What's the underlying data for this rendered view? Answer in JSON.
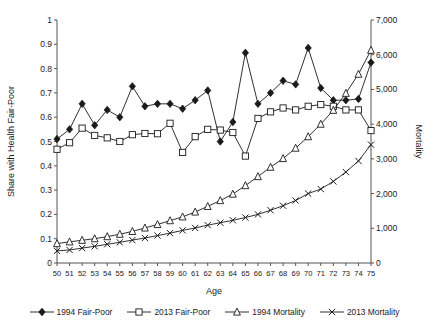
{
  "chart_data": {
    "type": "line",
    "title": "",
    "xlabel": "Age",
    "ylabel": "Share with Health Fair-Poor",
    "y2label": "Mortality",
    "xlim": [
      50,
      75
    ],
    "ylim": [
      0,
      1
    ],
    "y2lim": [
      0,
      7000
    ],
    "grid": false,
    "legend_position": "bottom",
    "x": [
      50,
      51,
      52,
      53,
      54,
      55,
      56,
      57,
      58,
      59,
      60,
      61,
      62,
      63,
      64,
      65,
      66,
      67,
      68,
      69,
      70,
      71,
      72,
      73,
      74,
      75
    ],
    "xtick_labels": [
      "50",
      "51",
      "52",
      "53",
      "54",
      "55",
      "56",
      "57",
      "58",
      "59",
      "60",
      "61",
      "62",
      "63",
      "64",
      "65",
      "66",
      "67",
      "68",
      "69",
      "70",
      "71",
      "72",
      "73",
      "74",
      "75"
    ],
    "ytick_labels": [
      "0",
      "0.1",
      "0.2",
      "0.3",
      "0.4",
      "0.5",
      "0.6",
      "0.7",
      "0.8",
      "0.9",
      "1"
    ],
    "ytick_values": [
      0,
      0.1,
      0.2,
      0.3,
      0.4,
      0.5,
      0.6,
      0.7,
      0.8,
      0.9,
      1
    ],
    "y2tick_labels": [
      "0",
      "1,000",
      "2,000",
      "3,000",
      "4,000",
      "5,000",
      "6,000",
      "7,000"
    ],
    "y2tick_values": [
      0,
      1000,
      2000,
      3000,
      4000,
      5000,
      6000,
      7000
    ],
    "series": [
      {
        "name": "1994 Fair-Poor",
        "axis": "left",
        "marker": "filled-diamond",
        "values": [
          0.51,
          0.55,
          0.655,
          0.567,
          0.63,
          0.6,
          0.727,
          0.645,
          0.655,
          0.655,
          0.635,
          0.67,
          0.71,
          0.5,
          0.58,
          0.865,
          0.655,
          0.7,
          0.75,
          0.735,
          0.885,
          0.72,
          0.67,
          0.67,
          0.675,
          0.825
        ]
      },
      {
        "name": "2013 Fair-Poor",
        "axis": "left",
        "marker": "open-square",
        "values": [
          0.468,
          0.495,
          0.555,
          0.525,
          0.515,
          0.5,
          0.528,
          0.533,
          0.532,
          0.575,
          0.455,
          0.52,
          0.55,
          0.547,
          0.537,
          0.44,
          0.595,
          0.622,
          0.638,
          0.63,
          0.645,
          0.652,
          0.645,
          0.63,
          0.63,
          0.545
        ]
      },
      {
        "name": "1994 Mortality",
        "axis": "right",
        "marker": "open-triangle",
        "values": [
          560,
          610,
          655,
          700,
          760,
          830,
          910,
          1010,
          1110,
          1220,
          1330,
          1470,
          1630,
          1800,
          1985,
          2230,
          2490,
          2760,
          3010,
          3310,
          3640,
          4000,
          4400,
          4890,
          5440,
          6130
        ]
      },
      {
        "name": "2013 Mortality",
        "axis": "right",
        "marker": "x-cross",
        "values": [
          350,
          375,
          430,
          480,
          540,
          595,
          660,
          720,
          790,
          860,
          940,
          1010,
          1090,
          1160,
          1230,
          1310,
          1400,
          1520,
          1650,
          1800,
          2000,
          2130,
          2350,
          2620,
          2940,
          3410
        ]
      }
    ]
  },
  "legend": {
    "items": [
      {
        "label": "1994 Fair-Poor",
        "marker": "filled-diamond"
      },
      {
        "label": "2013 Fair-Poor",
        "marker": "open-square"
      },
      {
        "label": "1994 Mortality",
        "marker": "open-triangle"
      },
      {
        "label": "2013 Mortality",
        "marker": "x-cross"
      }
    ]
  }
}
